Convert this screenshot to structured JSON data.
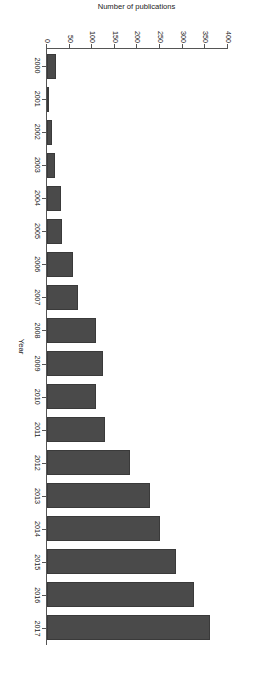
{
  "chart_data": {
    "type": "bar",
    "title": "",
    "subtitle": "",
    "orientation": "vertical",
    "xlabel": "Year",
    "ylabel": "Number of publications",
    "categories": [
      "2000",
      "2001",
      "2002",
      "2003",
      "2004",
      "2005",
      "2006",
      "2007",
      "2008",
      "2009",
      "2010",
      "2011",
      "2012",
      "2013",
      "2014",
      "2015",
      "2016",
      "2017"
    ],
    "values": [
      19,
      5,
      11,
      17,
      31,
      33,
      58,
      69,
      108,
      123,
      108,
      129,
      183,
      227,
      250,
      285,
      325,
      360
    ],
    "series": [
      {
        "name": "Number of publications",
        "values": [
          19,
          5,
          11,
          17,
          31,
          33,
          58,
          69,
          108,
          123,
          108,
          129,
          183,
          227,
          250,
          285,
          325,
          360
        ]
      }
    ],
    "ylim": [
      0,
      400
    ],
    "ytick_values": [
      0,
      50,
      100,
      150,
      200,
      250,
      300,
      350,
      400
    ],
    "ytick_labels": [
      "0",
      "50",
      "100",
      "150",
      "200",
      "250",
      "300",
      "350",
      "400"
    ],
    "xtick_labels": [
      "2000",
      "2001",
      "2002",
      "2003",
      "2004",
      "2005",
      "2006",
      "2007",
      "2008",
      "2009",
      "2010",
      "2011",
      "2012",
      "2013",
      "2014",
      "2015",
      "2016",
      "2017"
    ],
    "grid": false,
    "legend": false,
    "legend_position": "none",
    "bar_color": "#4a4a4a",
    "axis_color": "#555555",
    "background_color": "#ffffff",
    "annotations": []
  },
  "figure": {
    "rotation_degrees": 90,
    "page_background": "#ffffff"
  }
}
